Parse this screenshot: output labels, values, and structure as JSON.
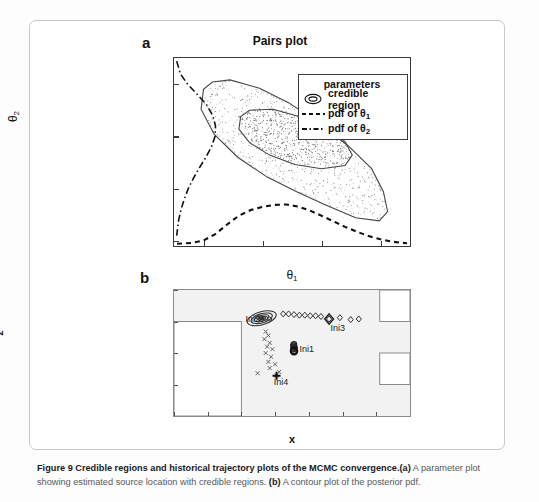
{
  "figure": {
    "caption_bold": "Figure 9 Credible regions and historical trajectory plots of the MCMC convergence.",
    "caption_a_tag": "(a)",
    "caption_a_text": " A parameter plot showing estimated source location with credible regions. ",
    "caption_b_tag": "(b)",
    "caption_b_text": " A contour plot of the posterior pdf."
  },
  "panel_a": {
    "letter": "a",
    "title": "Pairs plot",
    "legend": {
      "title": "parameters",
      "items": [
        {
          "label": "credible region",
          "key": "contour-ellipse-icon"
        },
        {
          "label": "pdf of θ",
          "sub": "1",
          "key": "dashed-line-icon"
        },
        {
          "label": "pdf of θ",
          "sub": "2",
          "key": "dashdot-line-icon"
        }
      ]
    }
  },
  "panel_b": {
    "letter": "b",
    "markers": [
      {
        "label": "Ini1",
        "x": 0.78,
        "z": -0.95
      },
      {
        "label": "Ini2",
        "x": 0.18,
        "z": -0.48
      },
      {
        "label": "Ini3",
        "x": 1.38,
        "z": -0.56
      },
      {
        "label": "Ini4",
        "x": 0.52,
        "z": -1.38
      }
    ]
  },
  "chart_data": [
    {
      "type": "scatter",
      "id": "pairs-plot",
      "title": "Pairs plot",
      "xlabel": "θ₁",
      "ylabel": "θ₂",
      "xlim": [
        0.25,
        0.65
      ],
      "ylim": [
        -0.555,
        -0.375
      ],
      "xticks": [
        0.3,
        0.4,
        0.5,
        0.6
      ],
      "xticklabels": [
        "0.3",
        "0.4",
        "0.5",
        "0.6"
      ],
      "yticks": [
        -0.4,
        -0.45,
        -0.5,
        -0.55
      ],
      "yticklabels": [
        "−0.4",
        "−0.45",
        "−0.5",
        "−0.55"
      ],
      "grid": false,
      "legend_position": "upper-right",
      "series": [
        {
          "name": "credible region",
          "type": "contour",
          "levels": 2,
          "outer_contour": [
            [
              0.315,
              -0.398
            ],
            [
              0.345,
              -0.396
            ],
            [
              0.395,
              -0.404
            ],
            [
              0.445,
              -0.418
            ],
            [
              0.495,
              -0.437
            ],
            [
              0.545,
              -0.459
            ],
            [
              0.585,
              -0.481
            ],
            [
              0.605,
              -0.503
            ],
            [
              0.612,
              -0.522
            ],
            [
              0.598,
              -0.531
            ],
            [
              0.558,
              -0.528
            ],
            [
              0.508,
              -0.516
            ],
            [
              0.458,
              -0.503
            ],
            [
              0.408,
              -0.489
            ],
            [
              0.358,
              -0.47
            ],
            [
              0.318,
              -0.448
            ],
            [
              0.296,
              -0.424
            ],
            [
              0.3,
              -0.405
            ],
            [
              0.315,
              -0.398
            ]
          ],
          "inner_contour": [
            [
              0.378,
              -0.425
            ],
            [
              0.418,
              -0.424
            ],
            [
              0.462,
              -0.431
            ],
            [
              0.505,
              -0.442
            ],
            [
              0.54,
              -0.455
            ],
            [
              0.552,
              -0.468
            ],
            [
              0.54,
              -0.478
            ],
            [
              0.5,
              -0.481
            ],
            [
              0.455,
              -0.477
            ],
            [
              0.412,
              -0.468
            ],
            [
              0.378,
              -0.456
            ],
            [
              0.36,
              -0.443
            ],
            [
              0.363,
              -0.431
            ],
            [
              0.378,
              -0.425
            ]
          ]
        },
        {
          "name": "pdf of θ₁",
          "type": "density-marginal-x",
          "linestyle": "dashed",
          "peak_x": 0.43,
          "x": [
            0.255,
            0.28,
            0.3,
            0.32,
            0.34,
            0.36,
            0.38,
            0.4,
            0.42,
            0.44,
            0.46,
            0.48,
            0.5,
            0.52,
            0.54,
            0.56,
            0.58,
            0.6,
            0.62,
            0.645
          ],
          "y": [
            0.02,
            0.04,
            0.1,
            0.26,
            0.5,
            0.72,
            0.86,
            0.94,
            0.99,
            1.0,
            0.95,
            0.85,
            0.72,
            0.58,
            0.44,
            0.32,
            0.21,
            0.13,
            0.07,
            0.03
          ]
        },
        {
          "name": "pdf of θ₂",
          "type": "density-marginal-y",
          "linestyle": "dashdot",
          "peak_y": -0.452,
          "y": [
            -0.378,
            -0.39,
            -0.4,
            -0.41,
            -0.42,
            -0.43,
            -0.44,
            -0.45,
            -0.46,
            -0.47,
            -0.48,
            -0.49,
            -0.5,
            -0.51,
            -0.52,
            -0.53,
            -0.545
          ],
          "x": [
            0.03,
            0.12,
            0.3,
            0.55,
            0.78,
            0.93,
            1.0,
            0.99,
            0.9,
            0.76,
            0.6,
            0.45,
            0.32,
            0.22,
            0.14,
            0.08,
            0.03
          ]
        },
        {
          "name": "posterior samples",
          "type": "scatter-cloud",
          "n_points": 2600,
          "center": [
            0.44,
            -0.458
          ]
        }
      ]
    },
    {
      "type": "scatter",
      "id": "trajectory-contour-plot",
      "title": "",
      "xlabel": "x",
      "ylabel": "z",
      "xlim": [
        -1,
        2.5
      ],
      "ylim": [
        -2,
        0
      ],
      "xticks": [
        -1,
        -0.5,
        0,
        0.5,
        1,
        1.5,
        2,
        2.5
      ],
      "xticklabels": [
        "−1",
        "−0.5",
        "0",
        "0.5",
        "1",
        "1.5",
        "2",
        "2.5"
      ],
      "yticks": [
        0,
        -0.5,
        -1,
        -1.5,
        -2
      ],
      "yticklabels": [
        "0",
        "−0.5",
        "−1",
        "−1.5",
        "−2"
      ],
      "grid": false,
      "background": "#f2f2f2",
      "annotations": [
        "Ini1",
        "Ini2",
        "Ini3",
        "Ini4"
      ],
      "series": [
        {
          "name": "Ini1",
          "marker": "circle",
          "label_at": [
            0.86,
            -0.96
          ],
          "points": [
            [
              0.78,
              -0.86
            ],
            [
              0.78,
              -0.9
            ],
            [
              0.77,
              -0.94
            ],
            [
              0.78,
              -0.97
            ],
            [
              0.79,
              -0.92
            ],
            [
              0.77,
              -0.88
            ]
          ]
        },
        {
          "name": "Ini2",
          "marker": "contour-ellipse",
          "label_at": [
            0.06,
            -0.47
          ],
          "points": [
            [
              0.24,
              -0.43
            ],
            [
              0.3,
              -0.44
            ],
            [
              0.36,
              -0.45
            ],
            [
              0.42,
              -0.46
            ],
            [
              0.3,
              -0.47
            ]
          ]
        },
        {
          "name": "Ini3",
          "marker": "diamond",
          "label_at": [
            1.32,
            -0.62
          ],
          "points": [
            [
              0.62,
              -0.38
            ],
            [
              0.7,
              -0.38
            ],
            [
              0.78,
              -0.39
            ],
            [
              0.86,
              -0.4
            ],
            [
              0.94,
              -0.4
            ],
            [
              1.02,
              -0.41
            ],
            [
              1.1,
              -0.41
            ],
            [
              1.18,
              -0.42
            ],
            [
              1.3,
              -0.46
            ],
            [
              1.46,
              -0.44
            ],
            [
              1.62,
              -0.47
            ],
            [
              1.74,
              -0.46
            ]
          ]
        },
        {
          "name": "Ini4",
          "marker": "x-cross",
          "label_at": [
            0.48,
            -1.48
          ],
          "points": [
            [
              0.36,
              -0.66
            ],
            [
              0.4,
              -0.72
            ],
            [
              0.34,
              -0.78
            ],
            [
              0.42,
              -0.84
            ],
            [
              0.38,
              -0.9
            ],
            [
              0.46,
              -0.94
            ],
            [
              0.36,
              -1.0
            ],
            [
              0.44,
              -1.06
            ],
            [
              0.4,
              -1.14
            ],
            [
              0.5,
              -1.18
            ],
            [
              0.42,
              -1.24
            ],
            [
              0.56,
              -1.3
            ],
            [
              0.24,
              -1.32
            ],
            [
              0.52,
              -1.36
            ]
          ]
        }
      ],
      "domain_shapes": [
        {
          "name": "lower-left-void",
          "x0": -1,
          "x1": 0,
          "z0": -2,
          "z1": -0.5
        },
        {
          "name": "upper-right-void",
          "x0": 2.05,
          "x1": 2.5,
          "z0": -0.5,
          "z1": 0
        },
        {
          "name": "mid-right-void",
          "x0": 2.05,
          "x1": 2.5,
          "z0": -1.5,
          "z1": -1.0
        }
      ]
    }
  ]
}
